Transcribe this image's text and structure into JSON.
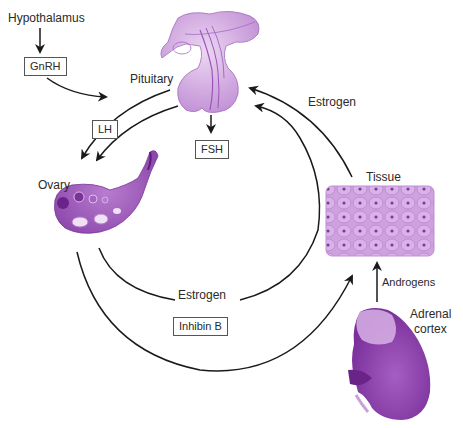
{
  "diagram": {
    "type": "hormonal feedback cycle",
    "nodes": {
      "hypothalamus": {
        "label": "Hypothalamus"
      },
      "gnrh": {
        "label": "GnRH"
      },
      "pituitary": {
        "label": "Pituitary"
      },
      "lh": {
        "label": "LH"
      },
      "fsh": {
        "label": "FSH"
      },
      "ovary": {
        "label": "Ovary"
      },
      "tissue": {
        "label": "Tissue"
      },
      "estrogen_top": {
        "label": "Estrogen"
      },
      "estrogen_bottom": {
        "label": "Estrogen"
      },
      "inhibin": {
        "label": "Inhibin B"
      },
      "androgens": {
        "label": "Androgens"
      },
      "adrenal_line1": {
        "label": "Adrenal"
      },
      "adrenal_line2": {
        "label": "cortex"
      }
    },
    "edges": [
      {
        "from": "Hypothalamus",
        "to": "GnRH"
      },
      {
        "from": "GnRH",
        "to": "Pituitary"
      },
      {
        "from": "Pituitary",
        "to": "Ovary",
        "via": "LH"
      },
      {
        "from": "Pituitary",
        "to": "Ovary"
      },
      {
        "from": "Pituitary",
        "to": "FSH"
      },
      {
        "from": "Ovary",
        "to": "Pituitary",
        "via": "Inhibin B"
      },
      {
        "from": "Ovary",
        "to": "Tissue",
        "via": "Estrogen"
      },
      {
        "from": "Tissue",
        "to": "Pituitary",
        "via": "Estrogen"
      },
      {
        "from": "Adrenal cortex",
        "to": "Tissue",
        "via": "Androgens"
      }
    ],
    "colors": {
      "organ_fill": "#c89ad8",
      "organ_dark": "#8a3fa8",
      "organ_light": "#e3c8ee",
      "line": "#1a1a1a"
    }
  }
}
